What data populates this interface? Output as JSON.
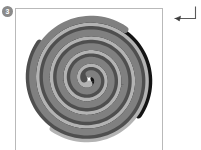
{
  "panel": {
    "badge_label": "3",
    "border_color": "#b9b9b9",
    "background": "#ffffff"
  },
  "glyphs": {
    "return_arrow": "return-arrow"
  },
  "figure": {
    "type": "spiral",
    "center_x": 74,
    "center_y": 71,
    "arm_count": 4,
    "turns": 4.1,
    "max_radius": 62,
    "stroke_width": 7,
    "arms": [
      {
        "name": "near-black-arm",
        "color": "#141414",
        "phase_deg": 0,
        "turns": 4.1,
        "start_radius": 5,
        "end_radius": 62
      },
      {
        "name": "light-gray-arm",
        "color": "#b3b3b3",
        "phase_deg": 90,
        "turns": 4.1,
        "start_radius": 5,
        "end_radius": 62
      },
      {
        "name": "dark-gray-arm",
        "color": "#4f4f4f",
        "phase_deg": 180,
        "turns": 4.1,
        "start_radius": 5,
        "end_radius": 62
      },
      {
        "name": "mid-gray-arm",
        "color": "#808080",
        "phase_deg": 270,
        "turns": 4.1,
        "start_radius": 5,
        "end_radius": 62
      }
    ],
    "palette": [
      "#141414",
      "#4f4f4f",
      "#808080",
      "#b3b3b3"
    ]
  }
}
